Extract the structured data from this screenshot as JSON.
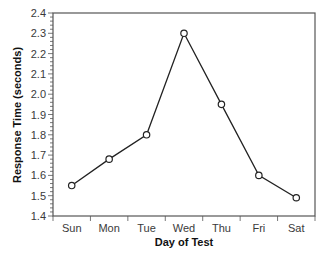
{
  "chart_data": {
    "type": "line",
    "title": "",
    "xlabel": "Day of Test",
    "ylabel": "Response Time (seconds)",
    "categories": [
      "Sun",
      "Mon",
      "Tue",
      "Wed",
      "Thu",
      "Fri",
      "Sat"
    ],
    "series": [
      {
        "name": "Response Time",
        "values": [
          1.55,
          1.68,
          1.8,
          2.3,
          1.95,
          1.6,
          1.49
        ],
        "marker": "open-circle",
        "color": "#222222"
      }
    ],
    "ylim": [
      1.4,
      2.4
    ],
    "yticks": [
      1.4,
      1.5,
      1.6,
      1.7,
      1.8,
      1.9,
      2.0,
      2.1,
      2.2,
      2.3,
      2.4
    ],
    "ytick_labels": [
      "1.4",
      "1.5",
      "1.6",
      "1.7",
      "1.8",
      "1.9",
      "2.0",
      "2.1",
      "2.2",
      "2.3",
      "2.4"
    ],
    "y_minor_step": 0.02,
    "grid": false,
    "legend": null
  },
  "style": {
    "axis_color": "#555555",
    "line_color": "#222222",
    "background": "#ffffff"
  }
}
